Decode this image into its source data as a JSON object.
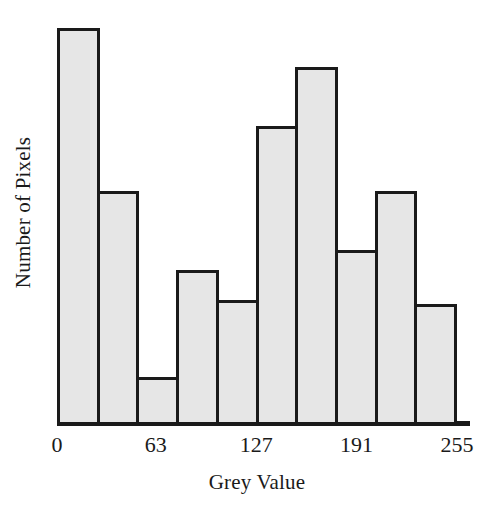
{
  "chart_data": {
    "type": "bar",
    "title": "",
    "subtitle": "",
    "xlabel": "Grey Value",
    "ylabel": "Number of Pixels",
    "grid": false,
    "legend": false,
    "legend_position": "none",
    "xlim": [
      0,
      255
    ],
    "ylim": [
      0,
      370
    ],
    "x_tick_labels": [
      "0",
      "63",
      "127",
      "191",
      "255"
    ],
    "x_tick_positions": [
      0,
      63,
      127,
      191,
      255
    ],
    "y_tick_labels": [],
    "bin_edges": [
      0,
      25.5,
      51,
      76.5,
      102,
      127.5,
      153,
      178.5,
      204,
      229.5,
      255
    ],
    "categories": [
      "0-25",
      "26-51",
      "52-76",
      "77-102",
      "103-127",
      "128-153",
      "154-178",
      "179-204",
      "205-229",
      "230-255"
    ],
    "values": [
      370,
      217,
      42,
      143,
      115,
      278,
      333,
      162,
      217,
      111
    ],
    "values_pct": [
      100.0,
      58.6,
      11.4,
      38.6,
      31.1,
      75.1,
      90.0,
      43.8,
      58.6,
      30.0
    ],
    "bar_fill_color": "#e6e6e6",
    "bar_edge_color": "#1a1a1a",
    "axis_color": "#1a1a1a",
    "background_color": "#ffffff"
  }
}
